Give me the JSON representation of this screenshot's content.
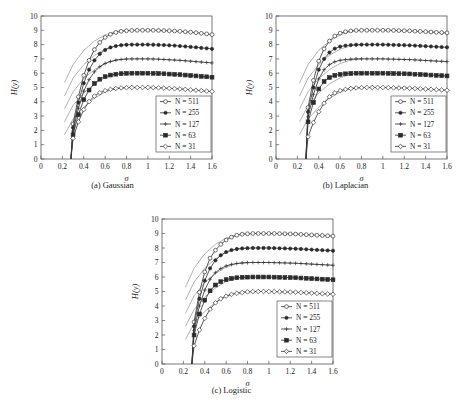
{
  "figure": {
    "background": "#ffffff",
    "line_color": "#3a3a3a",
    "ghost_color": "#7d7d7d",
    "axis_color": "#555555"
  },
  "chart_data": [
    {
      "type": "line",
      "id": "gaussian",
      "title": "(a) Gaussian",
      "xlabel": "σ",
      "ylabel": "H(y)",
      "xlim": [
        0,
        1.6
      ],
      "ylim": [
        0,
        10
      ],
      "xticks": [
        0,
        0.2,
        0.4,
        0.6,
        0.8,
        1,
        1.2,
        1.4,
        1.6
      ],
      "xticklabels": [
        "0",
        "0.2",
        "0.4",
        "0.6",
        "0.8",
        "1",
        "1.2",
        "1.4",
        "1.6"
      ],
      "yticks": [
        0,
        1,
        2,
        3,
        4,
        5,
        6,
        7,
        8,
        9,
        10
      ],
      "yticklabels": [
        "0",
        "1",
        "2",
        "3",
        "4",
        "5",
        "6",
        "7",
        "8",
        "9",
        "10"
      ],
      "grid": false,
      "legend_position": "lower right",
      "x": [
        0.28,
        0.3,
        0.35,
        0.4,
        0.45,
        0.5,
        0.55,
        0.6,
        0.65,
        0.7,
        0.75,
        0.8,
        0.85,
        0.9,
        0.95,
        1.0,
        1.05,
        1.1,
        1.15,
        1.2,
        1.25,
        1.3,
        1.35,
        1.4,
        1.45,
        1.5,
        1.55,
        1.6
      ],
      "series": [
        {
          "name": "N = 511",
          "marker": "circle-open",
          "plateau": 9.0,
          "values": [
            0.0,
            2.45,
            4.35,
            5.85,
            6.9,
            7.65,
            8.15,
            8.5,
            8.72,
            8.85,
            8.93,
            8.97,
            8.99,
            9.0,
            9.0,
            9.0,
            9.0,
            8.99,
            8.98,
            8.97,
            8.95,
            8.93,
            8.9,
            8.87,
            8.83,
            8.79,
            8.75,
            8.7
          ]
        },
        {
          "name": "N = 255",
          "marker": "dot-filled",
          "plateau": 8.0,
          "values": [
            0.0,
            2.2,
            3.95,
            5.3,
            6.25,
            6.9,
            7.35,
            7.63,
            7.8,
            7.9,
            7.96,
            7.99,
            8.0,
            8.0,
            8.0,
            8.0,
            7.99,
            7.98,
            7.97,
            7.95,
            7.93,
            7.9,
            7.87,
            7.84,
            7.81,
            7.77,
            7.74,
            7.7
          ]
        },
        {
          "name": "N = 127",
          "marker": "cross",
          "plateau": 7.0,
          "values": [
            0.0,
            1.95,
            3.55,
            4.75,
            5.55,
            6.1,
            6.45,
            6.68,
            6.82,
            6.91,
            6.96,
            6.99,
            7.0,
            7.0,
            7.0,
            7.0,
            6.99,
            6.98,
            6.96,
            6.94,
            6.92,
            6.9,
            6.87,
            6.84,
            6.81,
            6.78,
            6.75,
            6.72
          ]
        },
        {
          "name": "N = 63",
          "marker": "square",
          "plateau": 6.0,
          "values": [
            0.0,
            1.7,
            3.1,
            4.15,
            4.82,
            5.28,
            5.58,
            5.76,
            5.87,
            5.93,
            5.97,
            5.99,
            6.0,
            6.0,
            6.0,
            6.0,
            5.99,
            5.98,
            5.96,
            5.94,
            5.92,
            5.9,
            5.87,
            5.84,
            5.81,
            5.78,
            5.75,
            5.72
          ]
        },
        {
          "name": "N = 31",
          "marker": "diamond",
          "plateau": 5.0,
          "values": [
            0.0,
            1.45,
            2.6,
            3.45,
            4.02,
            4.4,
            4.63,
            4.78,
            4.87,
            4.93,
            4.97,
            4.99,
            5.0,
            5.0,
            5.0,
            5.0,
            4.99,
            4.98,
            4.96,
            4.94,
            4.92,
            4.9,
            4.87,
            4.84,
            4.81,
            4.78,
            4.75,
            4.72
          ]
        }
      ],
      "reference_curves_note": "thin unmarked asymptote curves, one per series",
      "reference_curves": [
        {
          "x": [
            0.22,
            0.3,
            0.4,
            0.5,
            0.6,
            0.7,
            0.8
          ],
          "values": [
            5.35,
            6.6,
            7.6,
            8.25,
            8.68,
            8.92,
            9.0
          ]
        },
        {
          "x": [
            0.22,
            0.3,
            0.4,
            0.5,
            0.6,
            0.7,
            0.8
          ],
          "values": [
            4.4,
            5.65,
            6.6,
            7.25,
            7.68,
            7.92,
            8.0
          ]
        },
        {
          "x": [
            0.22,
            0.3,
            0.4,
            0.5,
            0.6,
            0.7,
            0.8
          ],
          "values": [
            3.5,
            4.7,
            5.62,
            6.25,
            6.68,
            6.92,
            7.0
          ]
        },
        {
          "x": [
            0.22,
            0.3,
            0.4,
            0.5,
            0.6,
            0.7,
            0.8
          ],
          "values": [
            2.6,
            3.75,
            4.62,
            5.25,
            5.68,
            5.92,
            6.0
          ]
        },
        {
          "x": [
            0.22,
            0.3,
            0.4,
            0.5,
            0.6,
            0.7,
            0.8
          ],
          "values": [
            1.7,
            2.8,
            3.62,
            4.25,
            4.68,
            4.92,
            5.0
          ]
        }
      ]
    },
    {
      "type": "line",
      "id": "laplacian",
      "title": "(b) Laplacian",
      "xlabel": "σ",
      "ylabel": "H(y)",
      "xlim": [
        0,
        1.6
      ],
      "ylim": [
        0,
        10
      ],
      "xticks": [
        0,
        0.2,
        0.4,
        0.6,
        0.8,
        1,
        1.2,
        1.4,
        1.6
      ],
      "xticklabels": [
        "0",
        "0.2",
        "0.4",
        "0.6",
        "0.8",
        "1",
        "1.2",
        "1.4",
        "1.6"
      ],
      "yticks": [
        0,
        1,
        2,
        3,
        4,
        5,
        6,
        7,
        8,
        9,
        10
      ],
      "yticklabels": [
        "0",
        "1",
        "2",
        "3",
        "4",
        "5",
        "6",
        "7",
        "8",
        "9",
        "10"
      ],
      "grid": false,
      "legend_position": "lower right",
      "x": [
        0.28,
        0.3,
        0.35,
        0.4,
        0.45,
        0.5,
        0.55,
        0.6,
        0.65,
        0.7,
        0.75,
        0.8,
        0.85,
        0.9,
        0.95,
        1.0,
        1.05,
        1.1,
        1.15,
        1.2,
        1.25,
        1.3,
        1.35,
        1.4,
        1.45,
        1.5,
        1.55,
        1.6
      ],
      "series": [
        {
          "name": "N = 511",
          "marker": "circle-open",
          "plateau": 9.0,
          "values": [
            0.0,
            3.6,
            5.5,
            6.85,
            7.7,
            8.25,
            8.6,
            8.8,
            8.9,
            8.96,
            8.99,
            9.0,
            9.0,
            9.0,
            9.0,
            9.0,
            9.0,
            8.99,
            8.98,
            8.97,
            8.96,
            8.94,
            8.92,
            8.9,
            8.88,
            8.86,
            8.84,
            8.82
          ]
        },
        {
          "name": "N = 255",
          "marker": "dot-filled",
          "plateau": 8.0,
          "values": [
            0.0,
            3.3,
            5.0,
            6.25,
            7.0,
            7.45,
            7.72,
            7.86,
            7.93,
            7.97,
            7.99,
            8.0,
            8.0,
            8.0,
            8.0,
            8.0,
            7.99,
            7.98,
            7.97,
            7.96,
            7.95,
            7.93,
            7.91,
            7.89,
            7.87,
            7.85,
            7.83,
            7.81
          ]
        },
        {
          "name": "N = 127",
          "marker": "cross",
          "plateau": 7.0,
          "values": [
            0.0,
            2.95,
            4.5,
            5.6,
            6.25,
            6.6,
            6.8,
            6.9,
            6.95,
            6.98,
            7.0,
            7.0,
            7.0,
            7.0,
            7.0,
            7.0,
            6.99,
            6.98,
            6.97,
            6.96,
            6.95,
            6.93,
            6.91,
            6.89,
            6.87,
            6.85,
            6.83,
            6.81
          ]
        },
        {
          "name": "N = 63",
          "marker": "square",
          "plateau": 6.0,
          "values": [
            0.0,
            2.6,
            3.95,
            4.9,
            5.42,
            5.7,
            5.85,
            5.92,
            5.96,
            5.98,
            6.0,
            6.0,
            6.0,
            6.0,
            6.0,
            6.0,
            5.99,
            5.98,
            5.97,
            5.96,
            5.95,
            5.93,
            5.91,
            5.89,
            5.87,
            5.85,
            5.83,
            5.81
          ]
        },
        {
          "name": "N = 31",
          "marker": "diamond",
          "plateau": 5.0,
          "values": [
            0.0,
            1.55,
            2.55,
            3.3,
            3.9,
            4.35,
            4.62,
            4.78,
            4.87,
            4.93,
            4.97,
            4.99,
            5.0,
            5.0,
            5.0,
            5.0,
            4.99,
            4.98,
            4.97,
            4.96,
            4.95,
            4.93,
            4.91,
            4.89,
            4.87,
            4.85,
            4.83,
            4.81
          ]
        }
      ],
      "reference_curves": [
        {
          "x": [
            0.22,
            0.3,
            0.4,
            0.5,
            0.6,
            0.7,
            0.8
          ],
          "values": [
            5.3,
            6.6,
            7.6,
            8.25,
            8.68,
            8.92,
            9.0
          ]
        },
        {
          "x": [
            0.22,
            0.3,
            0.4,
            0.5,
            0.6,
            0.7,
            0.8
          ],
          "values": [
            4.4,
            5.65,
            6.6,
            7.25,
            7.68,
            7.92,
            8.0
          ]
        },
        {
          "x": [
            0.22,
            0.3,
            0.4,
            0.5,
            0.6,
            0.7,
            0.8
          ],
          "values": [
            3.5,
            4.7,
            5.62,
            6.25,
            6.68,
            6.92,
            7.0
          ]
        },
        {
          "x": [
            0.22,
            0.3,
            0.4,
            0.5,
            0.6,
            0.7,
            0.8
          ],
          "values": [
            2.6,
            3.75,
            4.62,
            5.25,
            5.68,
            5.92,
            6.0
          ]
        },
        {
          "x": [
            0.22,
            0.3,
            0.4,
            0.5,
            0.6,
            0.7,
            0.8
          ],
          "values": [
            1.7,
            2.8,
            3.62,
            4.25,
            4.68,
            4.92,
            5.0
          ]
        }
      ]
    },
    {
      "type": "line",
      "id": "logistic",
      "title": "(c) Logistic",
      "xlabel": "σ",
      "ylabel": "H(y)",
      "xlim": [
        0,
        1.6
      ],
      "ylim": [
        0,
        10
      ],
      "xticks": [
        0,
        0.2,
        0.4,
        0.6,
        0.8,
        1,
        1.2,
        1.4,
        1.6
      ],
      "xticklabels": [
        "0",
        "0.2",
        "0.4",
        "0.6",
        "0.8",
        "1",
        "1.2",
        "1.4",
        "1.6"
      ],
      "yticks": [
        0,
        1,
        2,
        3,
        4,
        5,
        6,
        7,
        8,
        9,
        10
      ],
      "yticklabels": [
        "0",
        "1",
        "2",
        "3",
        "4",
        "5",
        "6",
        "7",
        "8",
        "9",
        "10"
      ],
      "grid": false,
      "legend_position": "lower right",
      "x": [
        0.28,
        0.3,
        0.35,
        0.4,
        0.45,
        0.5,
        0.55,
        0.6,
        0.65,
        0.7,
        0.75,
        0.8,
        0.85,
        0.9,
        0.95,
        1.0,
        1.05,
        1.1,
        1.15,
        1.2,
        1.25,
        1.3,
        1.35,
        1.4,
        1.45,
        1.5,
        1.55,
        1.6
      ],
      "series": [
        {
          "name": "N = 511",
          "marker": "circle-open",
          "plateau": 9.0,
          "values": [
            0.0,
            2.9,
            4.95,
            6.35,
            7.3,
            7.85,
            8.25,
            8.55,
            8.75,
            8.88,
            8.95,
            8.98,
            9.0,
            9.0,
            9.0,
            9.0,
            9.0,
            8.99,
            8.98,
            8.97,
            8.96,
            8.94,
            8.92,
            8.9,
            8.88,
            8.86,
            8.84,
            8.82
          ]
        },
        {
          "name": "N = 255",
          "marker": "dot-filled",
          "plateau": 8.0,
          "values": [
            0.0,
            2.6,
            4.5,
            5.75,
            6.6,
            7.15,
            7.5,
            7.72,
            7.86,
            7.93,
            7.97,
            7.99,
            8.0,
            8.0,
            8.0,
            8.0,
            7.99,
            7.98,
            7.97,
            7.96,
            7.95,
            7.93,
            7.91,
            7.89,
            7.87,
            7.85,
            7.83,
            7.81
          ]
        },
        {
          "name": "N = 127",
          "marker": "cross",
          "plateau": 7.0,
          "values": [
            0.0,
            2.3,
            4.0,
            5.1,
            5.85,
            6.3,
            6.58,
            6.76,
            6.87,
            6.93,
            6.97,
            6.99,
            7.0,
            7.0,
            7.0,
            7.0,
            6.99,
            6.98,
            6.97,
            6.96,
            6.95,
            6.93,
            6.91,
            6.89,
            6.87,
            6.85,
            6.83,
            6.81
          ]
        },
        {
          "name": "N = 63",
          "marker": "square",
          "plateau": 6.0,
          "values": [
            0.0,
            2.0,
            3.45,
            4.4,
            5.05,
            5.45,
            5.68,
            5.82,
            5.9,
            5.95,
            5.98,
            5.99,
            6.0,
            6.0,
            6.0,
            6.0,
            5.99,
            5.98,
            5.97,
            5.96,
            5.95,
            5.93,
            5.91,
            5.89,
            5.87,
            5.85,
            5.83,
            5.81
          ]
        },
        {
          "name": "N = 31",
          "marker": "diamond",
          "plateau": 5.0,
          "values": [
            0.0,
            1.25,
            2.35,
            3.15,
            3.78,
            4.22,
            4.5,
            4.68,
            4.8,
            4.88,
            4.93,
            4.97,
            4.99,
            5.0,
            5.0,
            5.0,
            4.99,
            4.98,
            4.97,
            4.96,
            4.95,
            4.93,
            4.91,
            4.89,
            4.87,
            4.85,
            4.83,
            4.81
          ]
        }
      ],
      "reference_curves": [
        {
          "x": [
            0.22,
            0.3,
            0.4,
            0.5,
            0.6,
            0.7,
            0.8
          ],
          "values": [
            5.3,
            6.6,
            7.6,
            8.25,
            8.68,
            8.92,
            9.0
          ]
        },
        {
          "x": [
            0.22,
            0.3,
            0.4,
            0.5,
            0.6,
            0.7,
            0.8
          ],
          "values": [
            4.4,
            5.65,
            6.6,
            7.25,
            7.68,
            7.92,
            8.0
          ]
        },
        {
          "x": [
            0.22,
            0.3,
            0.4,
            0.5,
            0.6,
            0.7,
            0.8
          ],
          "values": [
            3.5,
            4.7,
            5.62,
            6.25,
            6.68,
            6.92,
            7.0
          ]
        },
        {
          "x": [
            0.22,
            0.3,
            0.4,
            0.5,
            0.6,
            0.7,
            0.8
          ],
          "values": [
            2.6,
            3.75,
            4.62,
            5.25,
            5.68,
            5.92,
            6.0
          ]
        },
        {
          "x": [
            0.22,
            0.3,
            0.4,
            0.5,
            0.6,
            0.7,
            0.8
          ],
          "values": [
            1.7,
            2.8,
            3.62,
            4.25,
            4.68,
            4.92,
            5.0
          ]
        }
      ]
    }
  ]
}
